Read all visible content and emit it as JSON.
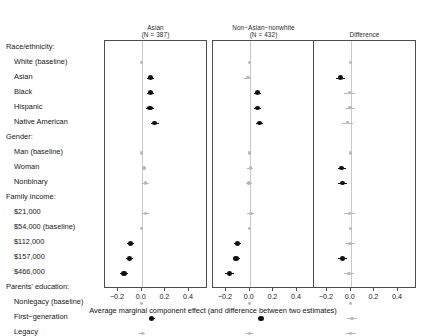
{
  "chart_data": {
    "type": "scatter",
    "subtype": "coefficient-plot-forest",
    "title": "",
    "xlabel": "Average marginal component effect (and difference between two estimates)",
    "ylabel": "",
    "xlim": [
      -0.31,
      0.56
    ],
    "xticks": [
      -0.2,
      0.0,
      0.2,
      0.4
    ],
    "xticklabels": [
      "−0.2",
      "0.0",
      "0.2",
      "0.4"
    ],
    "grid": false,
    "zero_reference_line": 0.0,
    "legend": "none",
    "panels": [
      {
        "label": "Asian",
        "n_label": "(N = 387)",
        "n": 387
      },
      {
        "label": "Non−Asian−nonwhite",
        "n_label": "(N = 432)",
        "n": 432
      },
      {
        "label": "Difference",
        "n_label": "",
        "n": null
      }
    ],
    "attribute_groups": [
      {
        "header": "Race/ethnicity:",
        "levels": [
          "White (baseline)",
          "Asian",
          "Black",
          "Hispanic",
          "Native American"
        ]
      },
      {
        "header": "Gender:",
        "levels": [
          "Man (baseline)",
          "Woman",
          "Nonbinary"
        ]
      },
      {
        "header": "Family income:",
        "levels": [
          "$21,000",
          "$54,000 (baseline)",
          "$112,000",
          "$157,000",
          "$466,000"
        ]
      },
      {
        "header": "Parents' education:",
        "levels": [
          "Nonlegacy (baseline)",
          "First−generation",
          "Legacy"
        ]
      }
    ],
    "rows": [
      {
        "label": "Race/ethnicity:",
        "is_header": true
      },
      {
        "label": "White (baseline)",
        "is_header": false,
        "baseline": true,
        "asian": {
          "est": 0.0,
          "lo": 0.0,
          "hi": 0.0
        },
        "nonasian": {
          "est": 0.0,
          "lo": 0.0,
          "hi": 0.0
        },
        "difference": {
          "est": 0.0,
          "lo": 0.0,
          "hi": 0.0
        }
      },
      {
        "label": "Asian",
        "is_header": false,
        "baseline": false,
        "asian": {
          "est": 0.075,
          "lo": 0.045,
          "hi": 0.105
        },
        "nonasian": {
          "est": -0.015,
          "lo": -0.045,
          "hi": 0.015
        },
        "difference": {
          "est": -0.085,
          "lo": -0.125,
          "hi": -0.045
        }
      },
      {
        "label": "Black",
        "is_header": false,
        "baseline": false,
        "asian": {
          "est": 0.075,
          "lo": 0.045,
          "hi": 0.105
        },
        "nonasian": {
          "est": 0.065,
          "lo": 0.035,
          "hi": 0.095
        },
        "difference": {
          "est": -0.01,
          "lo": -0.055,
          "hi": 0.035
        }
      },
      {
        "label": "Hispanic",
        "is_header": false,
        "baseline": false,
        "asian": {
          "est": 0.07,
          "lo": 0.04,
          "hi": 0.1
        },
        "nonasian": {
          "est": 0.065,
          "lo": 0.035,
          "hi": 0.095
        },
        "difference": {
          "est": -0.005,
          "lo": -0.05,
          "hi": 0.04
        }
      },
      {
        "label": "Native American",
        "is_header": false,
        "baseline": false,
        "asian": {
          "est": 0.11,
          "lo": 0.075,
          "hi": 0.145
        },
        "nonasian": {
          "est": 0.085,
          "lo": 0.055,
          "hi": 0.115
        },
        "difference": {
          "est": -0.025,
          "lo": -0.07,
          "hi": 0.02
        }
      },
      {
        "label": "Gender:",
        "is_header": true
      },
      {
        "label": "Man (baseline)",
        "is_header": false,
        "baseline": true,
        "asian": {
          "est": 0.0,
          "lo": 0.0,
          "hi": 0.0
        },
        "nonasian": {
          "est": 0.0,
          "lo": 0.0,
          "hi": 0.0
        },
        "difference": {
          "est": 0.0,
          "lo": 0.0,
          "hi": 0.0
        }
      },
      {
        "label": "Woman",
        "is_header": false,
        "baseline": false,
        "asian": {
          "est": 0.02,
          "lo": 0.0,
          "hi": 0.04
        },
        "nonasian": {
          "est": 0.005,
          "lo": -0.02,
          "hi": 0.03
        },
        "difference": {
          "est": -0.075,
          "lo": -0.11,
          "hi": -0.04
        }
      },
      {
        "label": "Nonbinary",
        "is_header": false,
        "baseline": false,
        "asian": {
          "est": 0.03,
          "lo": 0.0,
          "hi": 0.06
        },
        "nonasian": {
          "est": -0.005,
          "lo": -0.03,
          "hi": 0.02
        },
        "difference": {
          "est": -0.07,
          "lo": -0.105,
          "hi": -0.035
        }
      },
      {
        "label": "Family income:",
        "is_header": true
      },
      {
        "label": "$21,000",
        "is_header": false,
        "baseline": false,
        "asian": {
          "est": 0.03,
          "lo": 0.0,
          "hi": 0.06
        },
        "nonasian": {
          "est": 0.01,
          "lo": -0.02,
          "hi": 0.04
        },
        "difference": {
          "est": -0.01,
          "lo": -0.055,
          "hi": 0.035
        }
      },
      {
        "label": "$54,000 (baseline)",
        "is_header": false,
        "baseline": true,
        "asian": {
          "est": 0.0,
          "lo": 0.0,
          "hi": 0.0
        },
        "nonasian": {
          "est": 0.0,
          "lo": 0.0,
          "hi": 0.0
        },
        "difference": {
          "est": 0.0,
          "lo": 0.0,
          "hi": 0.0
        }
      },
      {
        "label": "$112,000",
        "is_header": false,
        "baseline": false,
        "asian": {
          "est": -0.095,
          "lo": -0.125,
          "hi": -0.065
        },
        "nonasian": {
          "est": -0.1,
          "lo": -0.13,
          "hi": -0.07
        },
        "difference": {
          "est": -0.005,
          "lo": -0.048,
          "hi": 0.038
        }
      },
      {
        "label": "$157,000",
        "is_header": false,
        "baseline": false,
        "asian": {
          "est": -0.1,
          "lo": -0.13,
          "hi": -0.07
        },
        "nonasian": {
          "est": -0.115,
          "lo": -0.145,
          "hi": -0.085
        },
        "difference": {
          "est": -0.07,
          "lo": -0.105,
          "hi": -0.035
        }
      },
      {
        "label": "$466,000",
        "is_header": false,
        "baseline": false,
        "asian": {
          "est": -0.15,
          "lo": -0.185,
          "hi": -0.115
        },
        "nonasian": {
          "est": -0.17,
          "lo": -0.205,
          "hi": -0.135
        },
        "difference": {
          "est": -0.015,
          "lo": -0.06,
          "hi": 0.03
        }
      },
      {
        "label": "Parents' education:",
        "is_header": true
      },
      {
        "label": "Nonlegacy (baseline)",
        "is_header": false,
        "baseline": true,
        "asian": {
          "est": 0.0,
          "lo": 0.0,
          "hi": 0.0
        },
        "nonasian": {
          "est": 0.0,
          "lo": 0.0,
          "hi": 0.0
        },
        "difference": {
          "est": 0.0,
          "lo": 0.0,
          "hi": 0.0
        }
      },
      {
        "label": "First−generation",
        "is_header": false,
        "baseline": false,
        "asian": {
          "est": 0.085,
          "lo": 0.058,
          "hi": 0.112
        },
        "nonasian": {
          "est": 0.095,
          "lo": 0.068,
          "hi": 0.122
        },
        "difference": {
          "est": 0.01,
          "lo": -0.03,
          "hi": 0.05
        }
      },
      {
        "label": "Legacy",
        "is_header": false,
        "baseline": false,
        "asian": {
          "est": 0.005,
          "lo": -0.02,
          "hi": 0.03
        },
        "nonasian": {
          "est": 0.0,
          "lo": -0.028,
          "hi": 0.028
        },
        "difference": {
          "est": 0.0,
          "lo": -0.042,
          "hi": 0.042
        }
      }
    ],
    "colors": {
      "estimate": "#101010",
      "baseline_or_nonsignificant": "#b9b9b9",
      "zero_line": "#c9c9c9",
      "frame": "#4d4d4d",
      "background": "#ffffff"
    }
  }
}
